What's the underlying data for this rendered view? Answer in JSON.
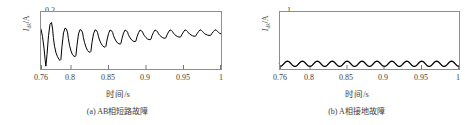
{
  "figure": {
    "background": "#ffffff",
    "line_color": "#000000",
    "frame_color": "#8e8e8e",
    "text_color": "#3d3d3d"
  },
  "chart_data": [
    {
      "type": "line",
      "panel_id": "a",
      "title": "",
      "caption": "(a) AB相短路故障",
      "xlabel": "时间/s",
      "ylabel": "I_dk/A",
      "ylabel_main": "I",
      "ylabel_sub": "dk",
      "ylabel_unit": "/A",
      "xlim": [
        0.76,
        1.0
      ],
      "ylim": [
        -0.4,
        0.2
      ],
      "grid": false,
      "legend": "none",
      "xticks": [
        0.76,
        0.8,
        0.85,
        0.9,
        0.95,
        1
      ],
      "xticklabels": [
        "0.76",
        "0.8",
        "0.85",
        "0.9",
        "0.95",
        "1"
      ],
      "yticks": [
        0.2,
        0,
        -0.4
      ],
      "yticklabels": [
        "0.2",
        "0",
        "-0.4"
      ],
      "series": [
        {
          "name": "AB相短路故障电流",
          "description": "damped sawtooth oscillation decaying toward zero",
          "x": [
            0.76,
            0.762,
            0.764,
            0.7655,
            0.7665,
            0.768,
            0.77,
            0.772,
            0.774,
            0.7755,
            0.7765,
            0.778,
            0.78,
            0.782,
            0.784,
            0.7855,
            0.7865,
            0.788,
            0.79,
            0.792,
            0.794,
            0.7955,
            0.7965,
            0.798,
            0.8,
            0.802,
            0.804,
            0.8055,
            0.8065,
            0.808,
            0.81,
            0.812,
            0.814,
            0.8155,
            0.8165,
            0.818,
            0.82,
            0.822,
            0.824,
            0.8255,
            0.8265,
            0.828,
            0.83,
            0.832,
            0.834,
            0.8355,
            0.8365,
            0.838,
            0.84,
            0.842,
            0.844,
            0.8455,
            0.8465,
            0.848,
            0.85,
            0.852,
            0.854,
            0.8555,
            0.8565,
            0.858,
            0.86,
            0.862,
            0.864,
            0.8655,
            0.8665,
            0.868,
            0.87,
            0.872,
            0.874,
            0.8755,
            0.8765,
            0.878,
            0.88,
            0.882,
            0.884,
            0.8855,
            0.8865,
            0.888,
            0.89,
            0.892,
            0.894,
            0.8955,
            0.8965,
            0.898,
            0.9,
            0.902,
            0.904,
            0.9055,
            0.9065,
            0.908,
            0.91,
            0.912,
            0.914,
            0.9155,
            0.9165,
            0.918,
            0.92,
            0.922,
            0.924,
            0.9255,
            0.9265,
            0.928,
            0.93,
            0.932,
            0.934,
            0.9355,
            0.9365,
            0.938,
            0.94,
            0.942,
            0.944,
            0.9455,
            0.9465,
            0.948,
            0.95,
            0.952,
            0.954,
            0.9555,
            0.9565,
            0.958,
            0.96,
            0.962,
            0.964,
            0.9655,
            0.9665,
            0.968,
            0.97,
            0.972,
            0.974,
            0.9755,
            0.9765,
            0.978,
            0.98,
            0.982,
            0.984,
            0.9855,
            0.9865,
            0.988,
            0.99,
            0.992,
            0.994,
            0.9955,
            0.9965,
            0.998,
            1.0
          ],
          "y": [
            0.02,
            -0.06,
            -0.18,
            -0.3,
            -0.37,
            -0.25,
            -0.05,
            0.07,
            0.09,
            0.02,
            -0.07,
            -0.16,
            -0.23,
            -0.27,
            -0.3,
            -0.31,
            -0.3,
            -0.16,
            -0.02,
            0.03,
            0.02,
            -0.02,
            -0.08,
            -0.15,
            -0.21,
            -0.25,
            -0.265,
            -0.27,
            -0.262,
            -0.15,
            -0.03,
            0.015,
            0.008,
            -0.02,
            -0.07,
            -0.12,
            -0.17,
            -0.205,
            -0.22,
            -0.225,
            -0.215,
            -0.12,
            -0.03,
            0.012,
            0.005,
            -0.018,
            -0.055,
            -0.095,
            -0.13,
            -0.155,
            -0.168,
            -0.17,
            -0.162,
            -0.095,
            -0.028,
            0.01,
            0.003,
            -0.015,
            -0.045,
            -0.075,
            -0.105,
            -0.125,
            -0.135,
            -0.138,
            -0.132,
            -0.078,
            -0.022,
            0.01,
            0.002,
            -0.013,
            -0.038,
            -0.062,
            -0.085,
            -0.102,
            -0.11,
            -0.112,
            -0.106,
            -0.062,
            -0.018,
            0.01,
            0.002,
            -0.011,
            -0.031,
            -0.051,
            -0.07,
            -0.084,
            -0.09,
            -0.092,
            -0.087,
            -0.05,
            -0.014,
            0.011,
            0.003,
            -0.009,
            -0.026,
            -0.043,
            -0.058,
            -0.07,
            -0.075,
            -0.076,
            -0.072,
            -0.041,
            -0.011,
            0.012,
            0.004,
            -0.008,
            -0.022,
            -0.036,
            -0.049,
            -0.059,
            -0.063,
            -0.064,
            -0.06,
            -0.034,
            -0.009,
            0.012,
            0.005,
            -0.006,
            -0.019,
            -0.031,
            -0.042,
            -0.05,
            -0.054,
            -0.055,
            -0.051,
            -0.029,
            -0.007,
            0.013,
            0.005,
            -0.005,
            -0.016,
            -0.027,
            -0.036,
            -0.043,
            -0.046,
            -0.047,
            -0.043,
            -0.024,
            -0.005,
            0.013,
            0.006,
            -0.004,
            -0.014,
            -0.023,
            -0.031,
            -0.038
          ]
        }
      ]
    },
    {
      "type": "line",
      "panel_id": "b",
      "title": "",
      "caption": "(b) A相接地故障",
      "xlabel": "时间/s",
      "ylabel": "I_dk/A",
      "ylabel_main": "I",
      "ylabel_sub": "dk",
      "ylabel_unit": "/A",
      "xlim": [
        0.76,
        1.0
      ],
      "ylim": [
        -0.1,
        1.0
      ],
      "grid": false,
      "legend": "none",
      "xticks": [
        0.76,
        0.8,
        0.85,
        0.9,
        0.95,
        1
      ],
      "xticklabels": [
        "0.76",
        "0.8",
        "0.85",
        "0.9",
        "0.95",
        "1"
      ],
      "yticks": [
        1,
        0,
        -0.1
      ],
      "yticklabels": [
        "1",
        "0",
        "-0.1"
      ],
      "series": [
        {
          "name": "A相接地故障电流",
          "description": "steady sinusoid ~50 Hz, amplitude about 0.05 A about zero",
          "amplitude": 0.05,
          "frequency_hz": 50,
          "offset": 0.0
        }
      ]
    }
  ]
}
